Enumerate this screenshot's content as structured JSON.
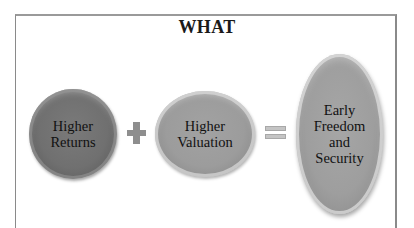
{
  "title": "WHAT",
  "equation": {
    "terms": [
      {
        "label_line1": "Higher",
        "label_line2": "Returns",
        "fill": "#707070"
      },
      {
        "label_line1": "Higher",
        "label_line2": "Valuation",
        "fill": "#9c9c9c"
      }
    ],
    "operator_plus": "plus-icon",
    "operator_equals": "equals-icon",
    "result": {
      "lines": [
        "Early",
        "Freedom",
        "and",
        "Security"
      ],
      "fill": "#9e9e9e"
    }
  }
}
